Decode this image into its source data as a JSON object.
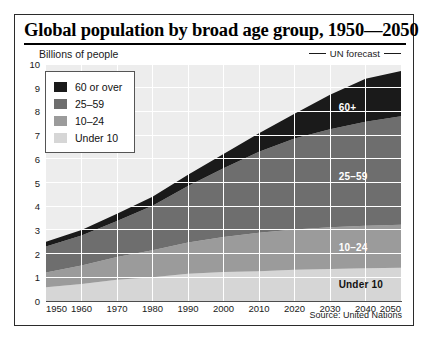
{
  "figure": {
    "title": "Global population by broad age group, 1950—2050",
    "unit_label": "Billions of people",
    "forecast_label": "UN forecast",
    "source": "Source: United Nations"
  },
  "legend": {
    "items": [
      {
        "label": "60 or over",
        "color": "#1a1a1a"
      },
      {
        "label": "25–59",
        "color": "#6e6e6e"
      },
      {
        "label": "10–24",
        "color": "#9b9b9b"
      },
      {
        "label": "Under 10",
        "color": "#d6d6d6"
      }
    ]
  },
  "annotations": [
    {
      "label": "60+",
      "tone": "light"
    },
    {
      "label": "25–59",
      "tone": "light"
    },
    {
      "label": "10–24",
      "tone": "light"
    },
    {
      "label": "Under 10",
      "tone": "dark"
    }
  ],
  "chart_data": {
    "type": "area",
    "stacked": true,
    "title": "Global population by broad age group, 1950—2050",
    "xlabel": "",
    "ylabel": "Billions of people",
    "xlim": [
      1950,
      2050
    ],
    "ylim": [
      0,
      10
    ],
    "grid": true,
    "legend_position": "top-left inside",
    "x": [
      1950,
      1960,
      1970,
      1980,
      1990,
      2000,
      2010,
      2020,
      2030,
      2040,
      2050
    ],
    "xticklabels": [
      "1950",
      "1960",
      "1970",
      "1980",
      "1990",
      "2000",
      "2010",
      "2020",
      "2030",
      "2040",
      "2050"
    ],
    "yticklabels": [
      "0",
      "1",
      "2",
      "3",
      "4",
      "5",
      "6",
      "7",
      "8",
      "9",
      "10"
    ],
    "forecast_starts": 2010,
    "series": [
      {
        "name": "Under 10",
        "color": "#d6d6d6",
        "values": [
          0.58,
          0.72,
          0.9,
          1.0,
          1.15,
          1.22,
          1.26,
          1.32,
          1.35,
          1.38,
          1.4
        ]
      },
      {
        "name": "10–24",
        "color": "#9b9b9b",
        "values": [
          0.62,
          0.78,
          0.96,
          1.14,
          1.32,
          1.48,
          1.62,
          1.7,
          1.76,
          1.8,
          1.82
        ]
      },
      {
        "name": "25–59",
        "color": "#6e6e6e",
        "values": [
          1.1,
          1.26,
          1.52,
          1.88,
          2.38,
          2.9,
          3.42,
          3.84,
          4.14,
          4.38,
          4.58
        ]
      },
      {
        "name": "60 or over",
        "color": "#1a1a1a",
        "values": [
          0.2,
          0.24,
          0.3,
          0.38,
          0.48,
          0.6,
          0.78,
          1.04,
          1.45,
          1.82,
          1.9
        ]
      }
    ],
    "totals": [
      2.5,
      3.0,
      3.68,
      4.4,
      5.33,
      6.2,
      7.08,
      7.9,
      8.7,
      9.38,
      9.7
    ],
    "annotation_labels": [
      "60+",
      "25–59",
      "10–24",
      "Under 10"
    ],
    "note": "UN forecast"
  }
}
